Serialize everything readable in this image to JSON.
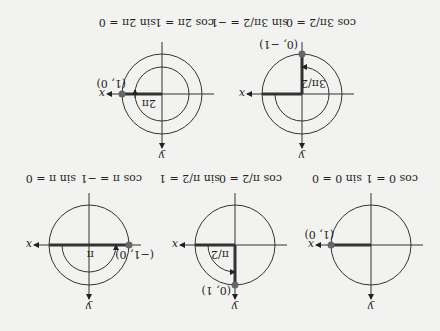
{
  "orientation": "rotated 180 degrees",
  "colors": {
    "background": "#f2f2f0",
    "line": "#333333",
    "point": "#666666"
  },
  "panels": [
    {
      "id": "angle-0",
      "point_label": "(1, 0)",
      "angle_label": "",
      "caption_cos": "cos 0 = 1",
      "caption_sin": "sin 0 = 0"
    },
    {
      "id": "angle-pi-over-2",
      "point_label": "(0, 1)",
      "angle_label": "π/2",
      "caption_cos": "cos π/2 = 0",
      "caption_sin": "sin π/2 = 1"
    },
    {
      "id": "angle-pi",
      "point_label": "(−1, 0)",
      "angle_label": "π",
      "caption_cos": "cos π = −1",
      "caption_sin": "sin π = 0"
    },
    {
      "id": "angle-3pi-over-2",
      "point_label": "(0, −1)",
      "angle_label": "3π/2",
      "caption_cos": "cos 3π/2 = 0",
      "caption_sin": "sin 3π/2 = −1"
    },
    {
      "id": "angle-2pi",
      "point_label": "(1, 0)",
      "angle_label": "2π",
      "caption_cos": "cos 2π = 1",
      "caption_sin": "sin 2π = 0"
    }
  ],
  "axes": {
    "x": "x",
    "y": "y"
  }
}
